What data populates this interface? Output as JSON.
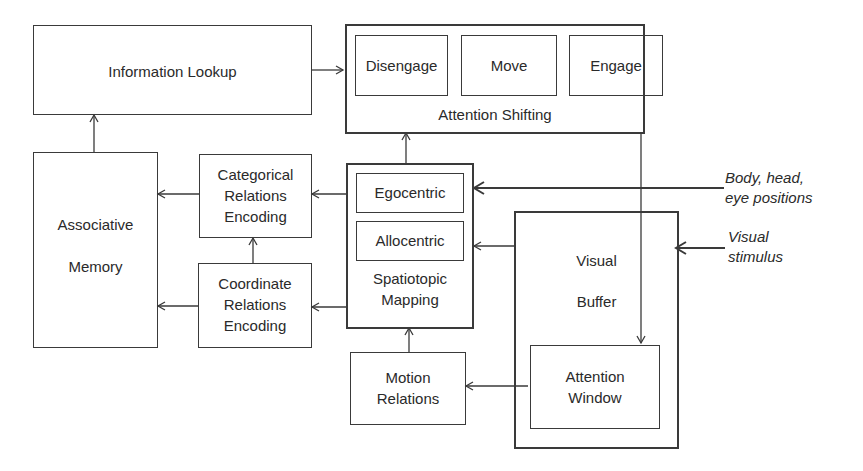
{
  "diagram": {
    "nodes": {
      "information_lookup": "Information Lookup",
      "disengage": "Disengage",
      "move": "Move",
      "engage": "Engage",
      "attention_shifting": "Attention Shifting",
      "associative_memory_1": "Associative",
      "associative_memory_2": "Memory",
      "categorical_1": "Categorical",
      "categorical_2": "Relations",
      "categorical_3": "Encoding",
      "coordinate_1": "Coordinate",
      "coordinate_2": "Relations",
      "coordinate_3": "Encoding",
      "egocentric": "Egocentric",
      "allocentric": "Allocentric",
      "spatiotopic_1": "Spatiotopic",
      "spatiotopic_2": "Mapping",
      "visual_buffer_1": "Visual",
      "visual_buffer_2": "Buffer",
      "attention_window_1": "Attention",
      "attention_window_2": "Window",
      "motion_1": "Motion",
      "motion_2": "Relations"
    },
    "inputs": {
      "body_1": "Body, head,",
      "body_2": "eye positions",
      "visual_1": "Visual",
      "visual_2": "stimulus"
    },
    "edges": [
      {
        "from": "Information Lookup",
        "to": "Attention Shifting"
      },
      {
        "from": "Associative Memory",
        "to": "Information Lookup"
      },
      {
        "from": "Categorical Relations Encoding",
        "to": "Associative Memory"
      },
      {
        "from": "Coordinate Relations Encoding",
        "to": "Associative Memory"
      },
      {
        "from": "Coordinate Relations Encoding",
        "to": "Categorical Relations Encoding"
      },
      {
        "from": "Spatiotopic Mapping",
        "to": "Categorical Relations Encoding"
      },
      {
        "from": "Spatiotopic Mapping",
        "to": "Coordinate Relations Encoding"
      },
      {
        "from": "Spatiotopic Mapping",
        "to": "Attention Shifting"
      },
      {
        "from": "Motion Relations",
        "to": "Spatiotopic Mapping"
      },
      {
        "from": "Visual Buffer",
        "to": "Spatiotopic Mapping"
      },
      {
        "from": "Attention Window",
        "to": "Motion Relations"
      },
      {
        "from": "Attention Shifting",
        "to": "Attention Window"
      },
      {
        "from": "Body, head, eye positions",
        "to": "Egocentric"
      },
      {
        "from": "Visual stimulus",
        "to": "Visual Buffer"
      }
    ]
  }
}
